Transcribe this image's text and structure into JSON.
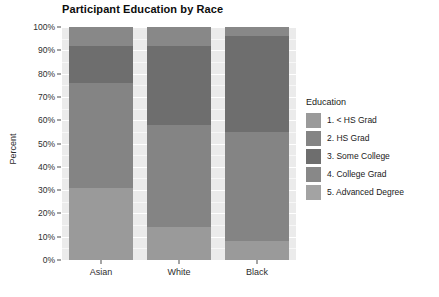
{
  "chart_data": {
    "type": "bar",
    "title": "Participant Education by Race",
    "subtitle": "",
    "xlabel": "",
    "ylabel": "Percent",
    "categories": [
      "Asian",
      "White",
      "Black"
    ],
    "ylim": [
      0,
      100
    ],
    "ytick_labels": [
      "0%",
      "10%",
      "20%",
      "30%",
      "40%",
      "50%",
      "60%",
      "70%",
      "80%",
      "90%",
      "100%"
    ],
    "ytick_values": [
      0,
      10,
      20,
      30,
      40,
      50,
      60,
      70,
      80,
      90,
      100
    ],
    "grid": true,
    "stacked": true,
    "stack_order": "bottom-to-top",
    "legend_title": "Education",
    "legend_position": "right",
    "series": [
      {
        "name": "1. < HS Grad",
        "color": "#9a9a9a",
        "values": [
          31.0,
          14.0,
          8.0
        ]
      },
      {
        "name": "2. HS Grad",
        "color": "#848484",
        "values": [
          45.0,
          44.0,
          47.0
        ]
      },
      {
        "name": "3. Some College",
        "color": "#6e6e6e",
        "values": [
          16.0,
          34.0,
          41.0
        ]
      },
      {
        "name": "4. College Grad",
        "color": "#888888",
        "values": [
          8.0,
          8.0,
          4.0
        ]
      },
      {
        "name": "5. Advanced Degree",
        "color": "#a3a3a3",
        "values": [
          0.0,
          0.0,
          0.0
        ]
      }
    ]
  },
  "colors": {
    "panel_background": "#ebebeb",
    "gridline_major": "#ffffff",
    "gridline_minor": "#f7f7f7",
    "axis_text": "#2e2e2e",
    "title_text": "#0d0d0d",
    "page_background": "#ffffff"
  }
}
